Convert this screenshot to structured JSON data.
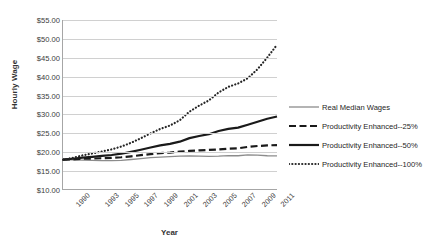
{
  "chart_data": {
    "type": "line",
    "title": "",
    "xlabel": "Year",
    "ylabel": "Hourly Wage",
    "x": [
      1990,
      1991,
      1992,
      1993,
      1994,
      1995,
      1996,
      1997,
      1998,
      1999,
      2000,
      2001,
      2002,
      2003,
      2004,
      2005,
      2006,
      2007,
      2008,
      2009,
      2010,
      2011,
      2012
    ],
    "xtick_labels": [
      "1990",
      "1993",
      "1995",
      "1997",
      "1999",
      "2001",
      "2003",
      "2005",
      "2007",
      "2009",
      "2011"
    ],
    "xtick_values": [
      1990,
      1993,
      1995,
      1997,
      1999,
      2001,
      2003,
      2005,
      2007,
      2009,
      2011
    ],
    "ytick_labels": [
      "$10.00",
      "$15.00",
      "$20.00",
      "$25.00",
      "$30.00",
      "$35.00",
      "$40.00",
      "$45.00",
      "$50.00",
      "$55.00"
    ],
    "ytick_values": [
      10,
      15,
      20,
      25,
      30,
      35,
      40,
      45,
      50,
      55
    ],
    "ylim": [
      10,
      55
    ],
    "xlim": [
      1990,
      2012
    ],
    "grid": true,
    "legend_position": "right",
    "series": [
      {
        "name": "Real Median Wages",
        "style": "solid-thin",
        "color": "#8c8c8c",
        "values": [
          17.8,
          17.75,
          17.7,
          17.6,
          17.55,
          17.55,
          17.6,
          17.85,
          18.1,
          18.35,
          18.5,
          18.6,
          18.75,
          18.8,
          18.75,
          18.7,
          18.75,
          18.9,
          18.85,
          19.1,
          19.0,
          18.85,
          18.8
        ]
      },
      {
        "name": "Productivity Enhanced--25%",
        "style": "dashed",
        "color": "#1a1a1a",
        "values": [
          17.8,
          17.9,
          18.05,
          18.1,
          18.2,
          18.3,
          18.45,
          18.7,
          19.0,
          19.3,
          19.55,
          19.7,
          19.95,
          20.15,
          20.3,
          20.4,
          20.55,
          20.75,
          20.85,
          21.2,
          21.45,
          21.6,
          21.7
        ]
      },
      {
        "name": "Productivity Enhanced--50%",
        "style": "solid-thick",
        "color": "#1a1a1a",
        "values": [
          17.8,
          18.05,
          18.35,
          18.55,
          18.8,
          19.05,
          19.4,
          19.9,
          20.45,
          21.05,
          21.6,
          22.0,
          22.6,
          23.55,
          24.1,
          24.6,
          25.45,
          26.0,
          26.35,
          27.1,
          27.9,
          28.7,
          29.3
        ]
      },
      {
        "name": "Productivity Enhanced--100%",
        "style": "dotted",
        "color": "#262626",
        "values": [
          17.8,
          18.3,
          18.95,
          19.45,
          20.0,
          20.55,
          21.3,
          22.3,
          23.5,
          24.8,
          26.0,
          26.9,
          28.3,
          30.6,
          32.2,
          33.6,
          35.7,
          37.2,
          38.1,
          39.5,
          41.9,
          45.0,
          48.4
        ]
      }
    ]
  }
}
